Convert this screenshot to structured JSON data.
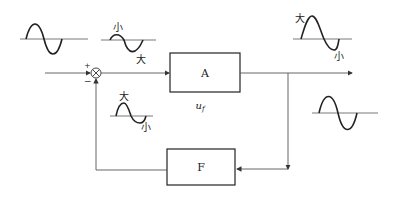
{
  "diagram": {
    "type": "feedback-block-diagram",
    "blocks": {
      "amplifier": {
        "label": "A"
      },
      "feedback": {
        "label": "F"
      }
    },
    "signal_label": {
      "base": "u",
      "sub": "f"
    },
    "summing_junction": {
      "plus": "+",
      "minus": "−"
    },
    "waveform_annotations": {
      "big": "大",
      "small": "小"
    },
    "colors": {
      "line": "#555555",
      "box": "#222222",
      "wave": "#222222"
    }
  }
}
